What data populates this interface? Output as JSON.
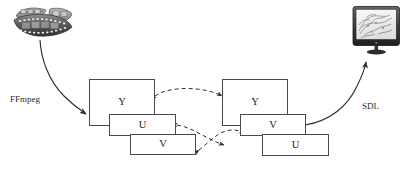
{
  "figure": {
    "type": "block-diagram",
    "title": "",
    "background_color": "#ffffff",
    "box_border_color": "#4a4a4a",
    "text_color": "#1b1b1b",
    "arrow_color": "#3a3a3a"
  },
  "source": {
    "icon": "film-strip-icon",
    "caption": ""
  },
  "sink": {
    "icon": "monitor-icon",
    "caption": ""
  },
  "pipeline_labels": {
    "decode": "FFmpeg",
    "render": "SDL"
  },
  "left_stack": {
    "name": "decoded-frame-planes",
    "planes": [
      {
        "label": "Y",
        "order": 1
      },
      {
        "label": "U",
        "order": 2
      },
      {
        "label": "V",
        "order": 3
      }
    ]
  },
  "right_stack": {
    "name": "display-frame-planes",
    "planes": [
      {
        "label": "Y",
        "order": 1
      },
      {
        "label": "V",
        "order": 2
      },
      {
        "label": "U",
        "order": 3
      }
    ]
  },
  "connections": [
    {
      "id": "film-to-decoder",
      "from": "film-strip-icon",
      "to": "left-plane-Y",
      "style": "solid",
      "arrowheads": "end",
      "label": "FFmpeg"
    },
    {
      "id": "y-to-y",
      "from": "left-plane-Y",
      "to": "right-plane-Y",
      "style": "dashed",
      "arrowheads": "both",
      "label": ""
    },
    {
      "id": "u-to-v",
      "from": "left-plane-U",
      "to": "right-plane-V",
      "style": "dashed",
      "arrowheads": "both",
      "label": ""
    },
    {
      "id": "v-to-u",
      "from": "left-plane-V",
      "to": "right-plane-U",
      "style": "dashed",
      "arrowheads": "both",
      "label": ""
    },
    {
      "id": "display-to-monitor",
      "from": "right-plane-V",
      "to": "monitor-icon",
      "style": "solid",
      "arrowheads": "end",
      "label": "SDL"
    }
  ]
}
